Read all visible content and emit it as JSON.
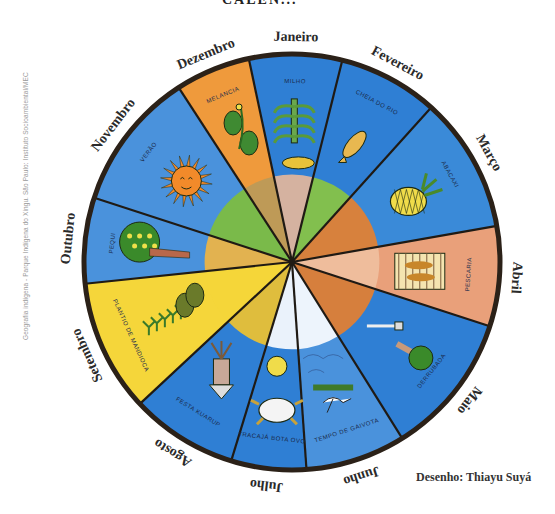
{
  "title_partial": "CALEN...",
  "credit": "Geografia indígena - Parque Indígena do Xingu. São Paulo: Instituto Socioambiental/MEC",
  "signature": "Desenho: Thiayu Suyá",
  "wheel": {
    "center": [
      292,
      262
    ],
    "radius": 208,
    "rim_color": "#2b2118",
    "months": [
      {
        "name": "Janeiro",
        "activity": "MILHO",
        "start": -12,
        "end": 14,
        "bg": "#2f7fd4",
        "inner": "#e8b89a",
        "icon": "corn"
      },
      {
        "name": "Fevereiro",
        "activity": "CHEIA DO RIO",
        "start": 14,
        "end": 42,
        "bg": "#2f7fd4",
        "inner": "#8cc63f",
        "icon": "fish"
      },
      {
        "name": "Março",
        "activity": "ABACAXI",
        "start": 42,
        "end": 80,
        "bg": "#3a8ad8",
        "inner": "#e9802c",
        "icon": "pineapple"
      },
      {
        "name": "Abril",
        "activity": "PESCARIA",
        "start": 80,
        "end": 108,
        "bg": "#e9a07a",
        "inner": "#f0c0a0",
        "icon": "fish-trap"
      },
      {
        "name": "Maio",
        "activity": "DERRUBADA",
        "start": 108,
        "end": 148,
        "bg": "#2f7fd4",
        "inner": "#e9802c",
        "icon": "axe-tree"
      },
      {
        "name": "Junho",
        "activity": "TEMPO DE GAIVOTA",
        "start": 148,
        "end": 176,
        "bg": "#4a92dc",
        "inner": "#ffffff",
        "icon": "gull"
      },
      {
        "name": "Julho",
        "activity": "TRACAJÁ BOTA OVO",
        "start": 176,
        "end": 197,
        "bg": "#2f7fd4",
        "inner": "#ffffff",
        "icon": "turtle"
      },
      {
        "name": "Agosto",
        "activity": "FESTA KUARUP",
        "start": 197,
        "end": 227,
        "bg": "#2f7fd4",
        "inner": "#f3c42c",
        "icon": "kuarup"
      },
      {
        "name": "Setembro",
        "activity": "PLANTIO DE MANDIOCA",
        "start": 227,
        "end": 264,
        "bg": "#f5d63a",
        "inner": "#f5d63a",
        "icon": "cassava"
      },
      {
        "name": "Outubro",
        "activity": "PEQUI",
        "start": 264,
        "end": 288,
        "bg": "#4a92dc",
        "inner": "#f3b640",
        "icon": "pequi-tree"
      },
      {
        "name": "Novembro",
        "activity": "VERÃO",
        "start": 288,
        "end": 327,
        "bg": "#4a92dc",
        "inner": "#7fbf3a",
        "icon": "sun"
      },
      {
        "name": "Dezembro",
        "activity": "MELANCIA",
        "start": 327,
        "end": 348,
        "bg": "#ef9a3c",
        "inner": "#b89a5a",
        "icon": "watermelon"
      }
    ]
  }
}
